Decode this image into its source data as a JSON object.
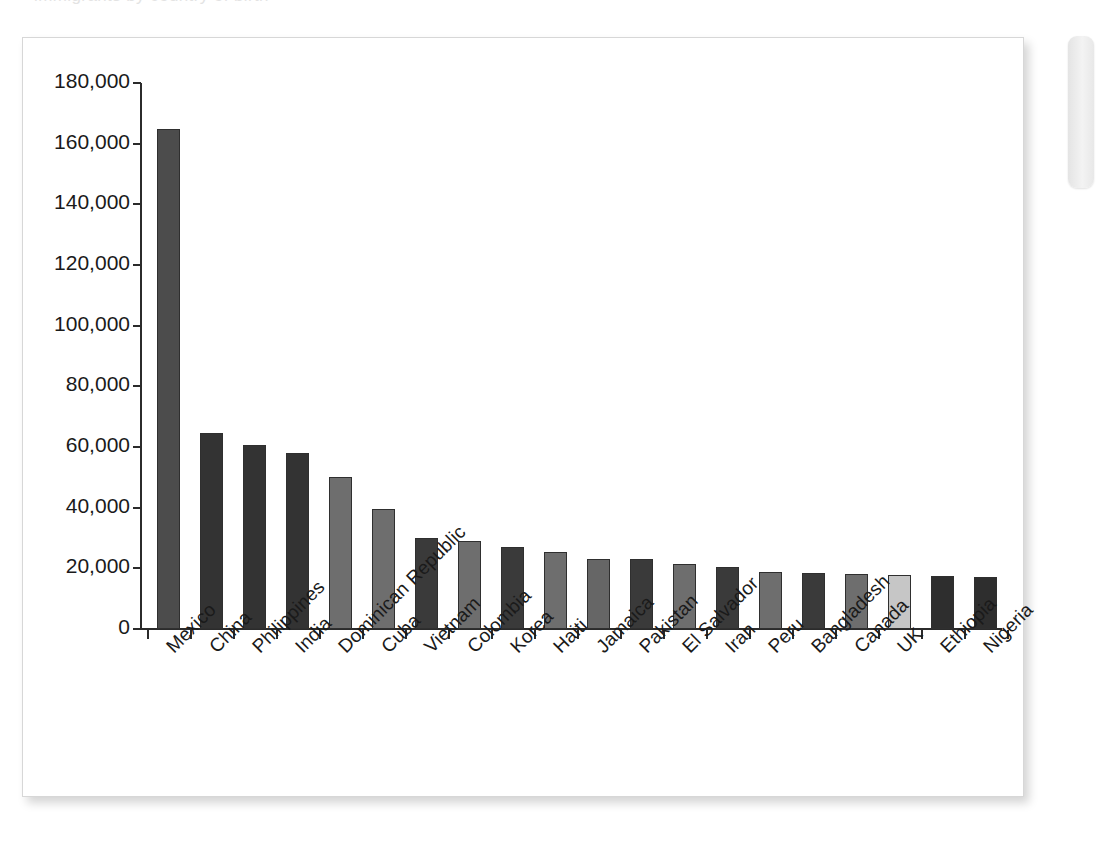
{
  "page": {
    "background_color": "#ffffff",
    "card_background": "#ffffff",
    "card_border_color": "#d7d7d7",
    "top_artifact_text": "immigrants by country of birth"
  },
  "side_tab": {
    "name": "page-side-tab",
    "color": "#ededed"
  },
  "chart_data": {
    "type": "bar",
    "title": "",
    "subtitle": "",
    "xlabel": "",
    "ylabel": "",
    "orientation": "vertical",
    "grid": false,
    "legend": null,
    "ylim": [
      0,
      180000
    ],
    "ytick_step": 20000,
    "ytick_labels": [
      "0",
      "20,000",
      "40,000",
      "60,000",
      "80,000",
      "100,000",
      "120,000",
      "140,000",
      "160,000",
      "180,000"
    ],
    "ytick_values": [
      0,
      20000,
      40000,
      60000,
      80000,
      100000,
      120000,
      140000,
      160000,
      180000
    ],
    "xtick_rotation": -45,
    "categories": [
      "Mexico",
      "China",
      "Philippines",
      "India",
      "Dominican Republic",
      "Cuba",
      "Vietnam",
      "Colombia",
      "Korea",
      "Haiti",
      "Jamaica",
      "Pakistan",
      "El Salvador",
      "Iran",
      "Peru",
      "Bangladesh",
      "Canada",
      "UK",
      "Ethiopia",
      "Nigeria"
    ],
    "values": [
      165000,
      64500,
      60500,
      58000,
      50000,
      39500,
      30000,
      29000,
      27000,
      25500,
      23000,
      23000,
      21500,
      20500,
      18800,
      18300,
      18000,
      17700,
      17400,
      17300
    ],
    "bar_colors": [
      "#4c4c4c",
      "#333333",
      "#333333",
      "#333333",
      "#6e6e6e",
      "#6e6e6e",
      "#3a3a3a",
      "#6e6e6e",
      "#3a3a3a",
      "#6e6e6e",
      "#666666",
      "#3a3a3a",
      "#6e6e6e",
      "#3a3a3a",
      "#6e6e6e",
      "#3a3a3a",
      "#6e6e6e",
      "#c6c6c6",
      "#2e2e2e",
      "#2e2e2e"
    ],
    "highlighted_category": "UK",
    "highlight_color": "#c6c6c6",
    "axis_color": "#2b2b2b",
    "text_color": "#1a1a1a"
  }
}
